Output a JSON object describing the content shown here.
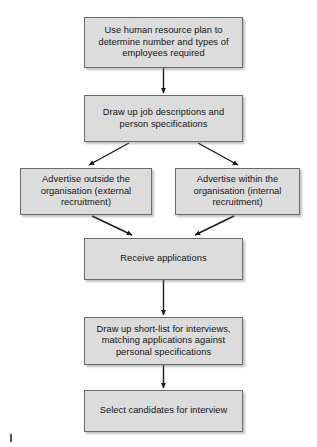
{
  "diagram": {
    "nodes": [
      {
        "id": "hr-plan",
        "text": "Use human resource plan to determine number and types of employees required"
      },
      {
        "id": "job-desc",
        "text": "Draw up job descriptions and person specifications"
      },
      {
        "id": "advertise-external",
        "text": "Advertise outside the organisation (external recruitment)"
      },
      {
        "id": "advertise-internal",
        "text": "Advertise within the organisation (internal recruitment)"
      },
      {
        "id": "receive-applications",
        "text": "Receive applications"
      },
      {
        "id": "shortlist",
        "text": "Draw up short-list for interviews, matching applications against personal specifications"
      },
      {
        "id": "select-candidates",
        "text": "Select candidates for interview"
      }
    ],
    "edges": [
      {
        "from": "hr-plan",
        "to": "job-desc",
        "style": "vertical"
      },
      {
        "from": "job-desc",
        "to": "advertise-external",
        "style": "diagonal-left"
      },
      {
        "from": "job-desc",
        "to": "advertise-internal",
        "style": "diagonal-right"
      },
      {
        "from": "advertise-external",
        "to": "receive-applications",
        "style": "diagonal-right"
      },
      {
        "from": "advertise-internal",
        "to": "receive-applications",
        "style": "diagonal-left"
      },
      {
        "from": "receive-applications",
        "to": "shortlist",
        "style": "vertical"
      },
      {
        "from": "shortlist",
        "to": "select-candidates",
        "style": "vertical"
      }
    ],
    "colors": {
      "node_fill": "#dcdcdc",
      "node_border": "#6b6b6b",
      "arrow": "#1a1a1a",
      "background": "#ffffff",
      "text": "#141414"
    }
  }
}
